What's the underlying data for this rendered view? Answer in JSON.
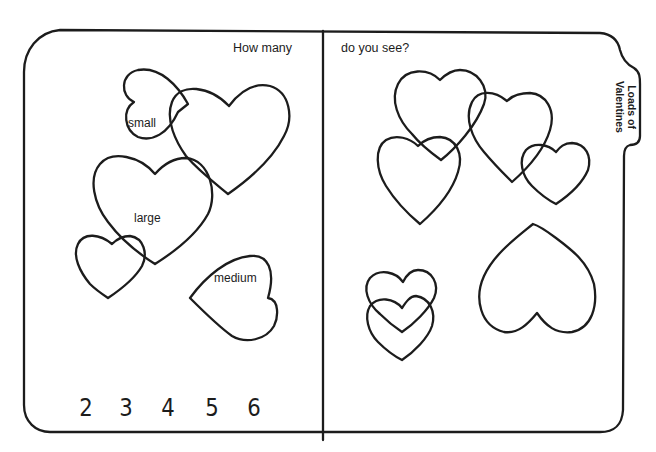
{
  "worksheet": {
    "tab_label_line1": "Loads of",
    "tab_label_line2": "Valentines",
    "question_part1": "How many",
    "question_part2": "do you see?",
    "left_panel": {
      "heart_labels": {
        "small": "small",
        "large": "large",
        "medium": "medium"
      },
      "answer_choices": [
        "2",
        "3",
        "4",
        "5",
        "6"
      ]
    },
    "colors": {
      "ink": "#1c1c1c",
      "paper": "#ffffff"
    }
  }
}
